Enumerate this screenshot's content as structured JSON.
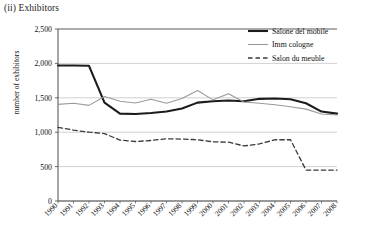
{
  "chart_data": {
    "type": "line",
    "title": "(ii) Exhibitors",
    "xlabel": "",
    "ylabel": "number of exhibitors",
    "x": [
      1990,
      1991,
      1992,
      1993,
      1994,
      1995,
      1996,
      1997,
      1998,
      1999,
      2000,
      2001,
      2002,
      2003,
      2004,
      2005,
      2006,
      2007,
      2008
    ],
    "xtick_labels": [
      "1990",
      "1991",
      "1992",
      "1993",
      "1994",
      "1995",
      "1996",
      "1997",
      "1998",
      "1999",
      "2000",
      "2001",
      "2002",
      "2003",
      "2004",
      "2005",
      "2006",
      "2007",
      "2008"
    ],
    "ytick_labels": [
      "0",
      "500",
      "1,000",
      "1,500",
      "2,000",
      "2,500"
    ],
    "yticks": [
      0,
      500,
      1000,
      1500,
      2000,
      2500
    ],
    "ylim": [
      0,
      2500
    ],
    "xlim": [
      1990,
      2008
    ],
    "grid": "horizontal",
    "legend_position": "top-right",
    "series": [
      {
        "name": "Salone del mobile",
        "style": "solid-thick",
        "color": "#1c1c1c",
        "values": [
          1970,
          1970,
          1965,
          1430,
          1270,
          1265,
          1280,
          1300,
          1345,
          1430,
          1450,
          1460,
          1450,
          1485,
          1490,
          1480,
          1420,
          1300,
          1270
        ]
      },
      {
        "name": "Imm cologne",
        "style": "solid-thin",
        "color": "#9a9a9a",
        "values": [
          1405,
          1420,
          1390,
          1520,
          1450,
          1425,
          1480,
          1420,
          1490,
          1605,
          1470,
          1560,
          1440,
          1420,
          1400,
          1370,
          1335,
          1265,
          1250
        ]
      },
      {
        "name": "Salon du meuble",
        "style": "dashed",
        "color": "#3a3a3a",
        "values": [
          1070,
          1030,
          1000,
          980,
          885,
          865,
          880,
          905,
          900,
          890,
          860,
          855,
          800,
          830,
          890,
          890,
          450,
          450,
          450
        ]
      }
    ]
  }
}
